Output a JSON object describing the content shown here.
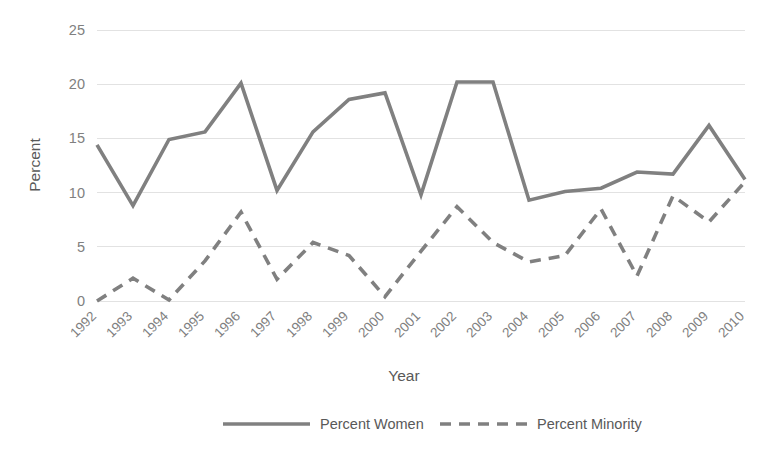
{
  "chart_data": {
    "type": "line",
    "title": "",
    "xlabel": "Year",
    "ylabel": "Percent",
    "categories": [
      "1992",
      "1993",
      "1994",
      "1995",
      "1996",
      "1997",
      "1998",
      "1999",
      "2000",
      "2001",
      "2002",
      "2003",
      "2004",
      "2005",
      "2006",
      "2007",
      "2008",
      "2009",
      "2010"
    ],
    "series": [
      {
        "name": "Percent Women",
        "style": "solid",
        "color": "#808080",
        "values": [
          14.4,
          8.8,
          14.9,
          15.6,
          20.1,
          10.2,
          15.6,
          18.6,
          19.2,
          9.8,
          20.2,
          20.2,
          9.3,
          10.1,
          10.4,
          11.9,
          11.7,
          16.2,
          11.2
        ]
      },
      {
        "name": "Percent Minority",
        "style": "dashed",
        "color": "#808080",
        "values": [
          0.0,
          2.1,
          0.1,
          3.7,
          8.2,
          2.0,
          5.4,
          4.2,
          0.4,
          4.6,
          8.7,
          5.4,
          3.6,
          4.2,
          8.5,
          2.3,
          9.7,
          7.3,
          11.0
        ]
      }
    ],
    "ylim": [
      0,
      25
    ],
    "yticks": [
      0,
      5,
      10,
      15,
      20,
      25
    ],
    "grid": true,
    "legend_position": "bottom",
    "xtick_rotation": -45
  },
  "axes": {
    "y_title": "Percent",
    "x_title": "Year"
  },
  "legend": {
    "items": [
      {
        "label": "Percent Women",
        "style": "solid"
      },
      {
        "label": "Percent Minority",
        "style": "dashed"
      }
    ]
  },
  "colors": {
    "line": "#808080",
    "grid": "#e2e2e2",
    "text": "#595959",
    "tick_text": "#808080",
    "background": "#ffffff"
  }
}
